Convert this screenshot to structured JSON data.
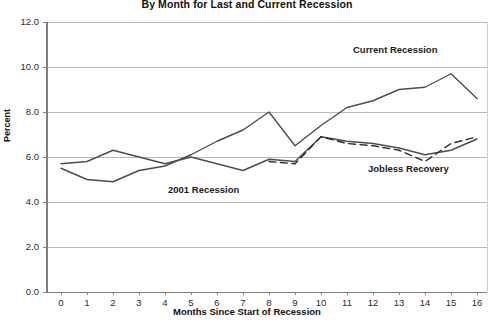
{
  "chart_data": {
    "type": "line",
    "title": "By Month for Last and Current Recession",
    "xlabel": "Months Since Start of Recession",
    "ylabel": "Percent",
    "x": [
      0,
      1,
      2,
      3,
      4,
      5,
      6,
      7,
      8,
      9,
      10,
      11,
      12,
      13,
      14,
      15,
      16
    ],
    "xlim": [
      0,
      16
    ],
    "ylim": [
      0.0,
      12.0
    ],
    "yticks": [
      "0.0",
      "2.0",
      "4.0",
      "6.0",
      "8.0",
      "10.0",
      "12.0"
    ],
    "ytick_values": [
      0.0,
      2.0,
      4.0,
      6.0,
      8.0,
      10.0,
      12.0
    ],
    "xticks": [
      "0",
      "1",
      "2",
      "3",
      "4",
      "5",
      "6",
      "7",
      "8",
      "9",
      "10",
      "11",
      "12",
      "13",
      "14",
      "15",
      "16"
    ],
    "grid": true,
    "legend_position": "inline-annotations",
    "series": [
      {
        "name": "Current Recession",
        "style": "solid",
        "color": "#4d4d4d",
        "values": [
          5.5,
          5.0,
          4.9,
          5.4,
          5.6,
          6.1,
          6.7,
          7.2,
          8.0,
          6.5,
          7.4,
          8.2,
          8.5,
          9.0,
          9.1,
          9.7,
          8.6
        ],
        "label_x": 12,
        "label_y": 10.6
      },
      {
        "name": "2001 Recession",
        "style": "solid",
        "color": "#4d4d4d",
        "values": [
          5.7,
          5.8,
          6.3,
          6.0,
          5.7,
          6.0,
          5.7,
          5.4,
          5.9,
          5.8,
          6.9,
          6.7,
          6.6,
          6.4,
          6.1,
          6.3,
          6.8
        ],
        "label_x": 5.5,
        "label_y": 4.4
      },
      {
        "name": "Jobless Recovery",
        "style": "dashed",
        "color": "#2a2a2a",
        "values": [
          null,
          null,
          null,
          null,
          null,
          null,
          null,
          null,
          5.8,
          5.7,
          6.9,
          6.6,
          6.5,
          6.3,
          5.8,
          6.6,
          6.9
        ],
        "label_x": 12,
        "label_y": 5.2
      }
    ],
    "annotations": [
      {
        "text": "Current Recession",
        "x_px": 353,
        "y_px": 44
      },
      {
        "text": "2001 Recession",
        "x_px": 168,
        "y_px": 184
      },
      {
        "text": "Jobless Recovery",
        "x_px": 368,
        "y_px": 163
      }
    ]
  },
  "axes": {
    "plot_left_px": 47,
    "plot_right_px": 487,
    "plot_top_px": 22,
    "plot_bottom_px": 292,
    "x0_px": 61,
    "x_step_px": 26,
    "grid_color": "#b9b9b9",
    "axis_color": "#808080"
  }
}
